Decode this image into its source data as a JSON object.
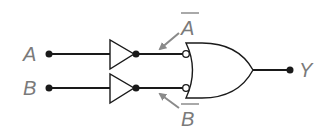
{
  "diagram": {
    "inputs": [
      {
        "label": "A",
        "x": 49,
        "y": 54
      },
      {
        "label": "B",
        "x": 49,
        "y": 88
      }
    ],
    "inverters": [
      {
        "input": "A",
        "output_label": "A",
        "overbar": true
      },
      {
        "input": "B",
        "output_label": "B",
        "overbar": true
      }
    ],
    "gate": {
      "type": "OR",
      "inverted_inputs": true
    },
    "output": {
      "label": "Y"
    },
    "colors": {
      "wire": "#1a1a1a",
      "label": "#7a7a7a",
      "arrow": "#8a8a8a",
      "background": "#ffffff"
    }
  }
}
